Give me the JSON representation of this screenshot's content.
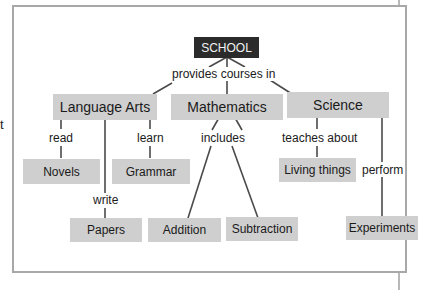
{
  "margin_text": "t",
  "diagram": {
    "root": "SCHOOL",
    "root_link": "provides courses in",
    "categories": [
      {
        "label": "Language Arts"
      },
      {
        "label": "Mathematics"
      },
      {
        "label": "Science"
      }
    ],
    "links": {
      "read": "read",
      "learn": "learn",
      "write": "write",
      "includes": "includes",
      "teaches_about": "teaches about",
      "perform": "perform"
    },
    "leaves": {
      "novels": "Novels",
      "grammar": "Grammar",
      "papers": "Papers",
      "addition": "Addition",
      "subtraction": "Subtraction",
      "living_things": "Living things",
      "experiments": "Experiments"
    }
  }
}
